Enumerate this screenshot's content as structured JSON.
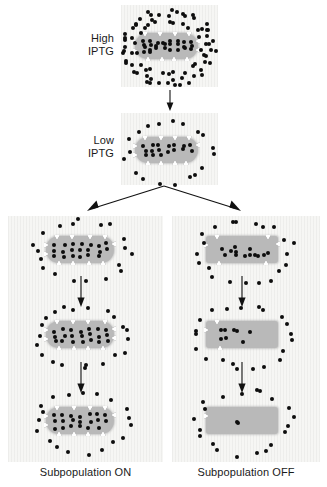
{
  "figure": {
    "type": "biological-schematic",
    "legend_symbols": {
      "black-dot": "IPTG inducer molecule",
      "white-triangle": "LacY permease transporter",
      "gray-rounded-rect": "bacterial cell"
    },
    "colors": {
      "panel_background": "#f6f6f4",
      "cell_fill": "#b9b9b9",
      "dot": "#0d0d0d",
      "transporter": "#ffffff",
      "arrow": "#111111",
      "text": "#1a1a1a"
    }
  },
  "labels": {
    "high_iptg_line1": "High",
    "high_iptg_line2": "IPTG",
    "low_iptg_line1": "Low",
    "low_iptg_line2": "IPTG",
    "subpopulation_on": "Subpopulation ON",
    "subpopulation_off": "Subpopulation OFF"
  },
  "panels": [
    {
      "id": "high-iptg",
      "name": "High IPTG panel",
      "cell_shape": "rounded",
      "internal_dots": 26,
      "external_dots": 78,
      "transporters": 12,
      "state": "fully induced"
    },
    {
      "id": "low-iptg",
      "name": "Low IPTG panel",
      "cell_shape": "rounded",
      "internal_dots": 17,
      "external_dots": 19,
      "transporters": 11,
      "state": "induced, inducer diluted"
    },
    {
      "id": "on-step-1",
      "name": "Subpopulation ON generation 1",
      "cell_shape": "rounded",
      "internal_dots": 20,
      "external_dots": 19,
      "transporters": 11,
      "state": "ON"
    },
    {
      "id": "on-step-2",
      "name": "Subpopulation ON generation 2",
      "cell_shape": "rounded",
      "internal_dots": 21,
      "external_dots": 21,
      "transporters": 12,
      "state": "ON"
    },
    {
      "id": "on-step-3",
      "name": "Subpopulation ON generation 3",
      "cell_shape": "rounded",
      "internal_dots": 20,
      "external_dots": 19,
      "transporters": 11,
      "state": "ON"
    },
    {
      "id": "off-step-1",
      "name": "Subpopulation OFF generation 1",
      "cell_shape": "square",
      "internal_dots": 13,
      "external_dots": 21,
      "transporters": 6,
      "state": "switching OFF"
    },
    {
      "id": "off-step-2",
      "name": "Subpopulation OFF generation 2",
      "cell_shape": "square",
      "internal_dots": 8,
      "external_dots": 21,
      "transporters": 3,
      "state": "mostly OFF"
    },
    {
      "id": "off-step-3",
      "name": "Subpopulation OFF generation 3",
      "cell_shape": "square",
      "internal_dots": 2,
      "external_dots": 20,
      "transporters": 1,
      "state": "OFF"
    }
  ],
  "arrows": [
    {
      "id": "arrow-high-to-low",
      "name": "high-to-low-arrow",
      "direction": "down"
    },
    {
      "id": "arrow-branch",
      "name": "branching-arrow",
      "direction": "split-left-right"
    },
    {
      "id": "arrow-on-1",
      "name": "on-generation-arrow-1",
      "direction": "down"
    },
    {
      "id": "arrow-on-2",
      "name": "on-generation-arrow-2",
      "direction": "down"
    },
    {
      "id": "arrow-off-1",
      "name": "off-generation-arrow-1",
      "direction": "down"
    },
    {
      "id": "arrow-off-2",
      "name": "off-generation-arrow-2",
      "direction": "down"
    }
  ]
}
